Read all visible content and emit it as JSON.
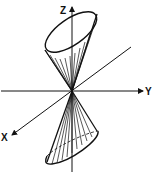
{
  "diagram": {
    "axes": {
      "x_label": "X",
      "y_label": "Y",
      "z_label": "Z"
    },
    "colors": {
      "ink": "#111111",
      "background": "#ffffff"
    }
  }
}
